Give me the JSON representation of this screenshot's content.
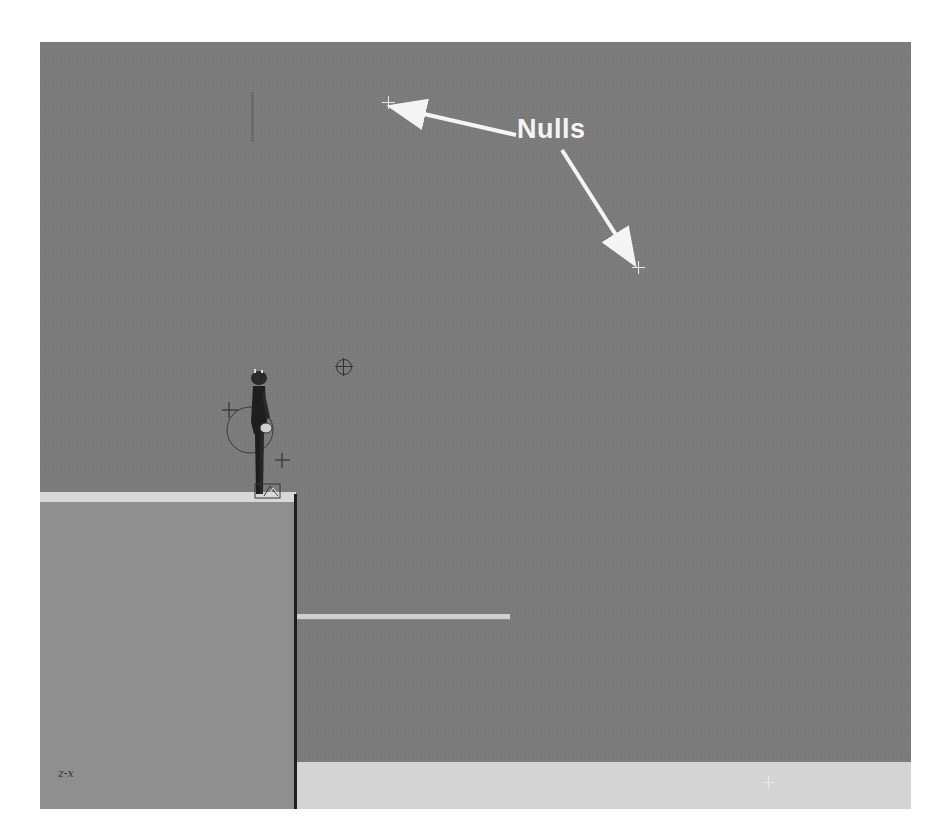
{
  "viewport": {
    "background_color": "#7c7c7c",
    "floor_color": "#d4d4d4",
    "cliff_color": "#8f8f8f",
    "cliff_top_color": "#d8d8d8",
    "ledge_color": "#d0d0d0"
  },
  "annotation": {
    "label": "Nulls",
    "color": "#f4f4f4",
    "arrows": [
      {
        "target": "null-upper-left"
      },
      {
        "target": "null-right"
      }
    ]
  },
  "scene_objects": {
    "nulls": [
      {
        "name": "null-upper-left"
      },
      {
        "name": "null-right"
      },
      {
        "name": "null-floor"
      }
    ],
    "character": {
      "name": "character-rig"
    },
    "control_markers": [
      "hip-control",
      "hand-control",
      "look-at-target"
    ]
  },
  "axis_indicator": {
    "label": "z-x"
  }
}
